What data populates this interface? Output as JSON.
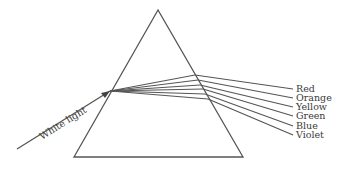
{
  "diagram": {
    "incoming_label": "White light",
    "line_color": "#555555",
    "text_color": "#3a3a3a",
    "prism": {
      "apex": [
        158,
        10
      ],
      "base_left": [
        74,
        157
      ],
      "base_right": [
        243,
        157
      ]
    },
    "incoming_ray": {
      "start": [
        17,
        149
      ],
      "entry": [
        110,
        91
      ]
    },
    "spectrum": [
      {
        "label": "Red",
        "exit": [
          195,
          75
        ],
        "end": [
          293,
          89
        ]
      },
      {
        "label": "Orange",
        "exit": [
          198,
          80
        ],
        "end": [
          293,
          98
        ]
      },
      {
        "label": "Yellow",
        "exit": [
          200,
          85
        ],
        "end": [
          293,
          107
        ]
      },
      {
        "label": "Green",
        "exit": [
          203,
          89
        ],
        "end": [
          293,
          116
        ]
      },
      {
        "label": "Blue",
        "exit": [
          205,
          94
        ],
        "end": [
          293,
          126
        ]
      },
      {
        "label": "Violet",
        "exit": [
          208,
          99
        ],
        "end": [
          293,
          135
        ]
      }
    ]
  }
}
